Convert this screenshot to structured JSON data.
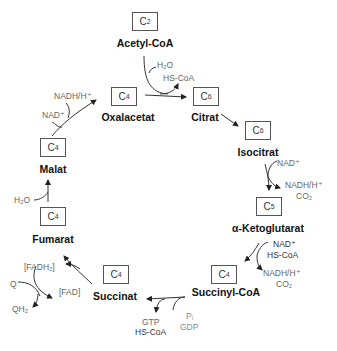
{
  "diagram": {
    "type": "citric-acid-cycle",
    "metabolites": [
      {
        "id": "acetyl-coa",
        "carbon": "C",
        "carbon_sub": "2",
        "name": "Acetyl-CoA"
      },
      {
        "id": "citrat",
        "carbon": "C",
        "carbon_sub": "6",
        "name": "Citrat"
      },
      {
        "id": "isocitrat",
        "carbon": "C",
        "carbon_sub": "6",
        "name": "Isocitrat"
      },
      {
        "id": "alpha-ketoglutarat",
        "carbon": "C",
        "carbon_sub": "5",
        "name": "α-Ketoglutarat"
      },
      {
        "id": "succinyl-coa",
        "carbon": "C",
        "carbon_sub": "4",
        "name": "Succinyl-CoA"
      },
      {
        "id": "succinat",
        "carbon": "C",
        "carbon_sub": "4",
        "name": "Succinat"
      },
      {
        "id": "fumarat",
        "carbon": "C",
        "carbon_sub": "4",
        "name": "Fumarat"
      },
      {
        "id": "malat",
        "carbon": "C",
        "carbon_sub": "4",
        "name": "Malat"
      },
      {
        "id": "oxalacetat",
        "carbon": "C",
        "carbon_sub": "4",
        "name": "Oxalacetat"
      }
    ],
    "cofactors": {
      "citrate_synthase": {
        "in": "H₂O",
        "out": "HS-CoA"
      },
      "isocitrate_dh": {
        "in": "NAD⁺",
        "out1": "NADH/H⁺",
        "out2": "CO₂"
      },
      "akg_dh": {
        "in1": "NAD⁺",
        "in2": "HS-CoA",
        "out1": "NADH/H⁺",
        "out2": "CO₂"
      },
      "succinyl_coa_synthetase": {
        "in1": "Pᵢ",
        "in2": "GDP",
        "out1": "GTP",
        "out2": "HS-CoA"
      },
      "succinate_dh": {
        "enzyme_in": "[FAD]",
        "enzyme_out": "[FADH₂]",
        "q_in": "Q",
        "q_out": "QH₂"
      },
      "fumarase": {
        "in": "H₂O"
      },
      "malate_dh": {
        "in": "NAD⁺",
        "out": "NADH/H⁺"
      }
    }
  }
}
